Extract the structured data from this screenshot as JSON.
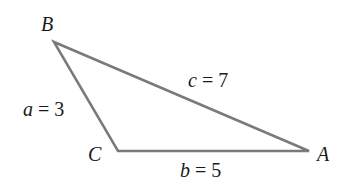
{
  "diagram": {
    "type": "triangle",
    "stroke_color": "#7a7a7a",
    "vertices": {
      "A": {
        "label": "A",
        "x": 309,
        "y": 151
      },
      "B": {
        "label": "B",
        "x": 54,
        "y": 42
      },
      "C": {
        "label": "C",
        "x": 118,
        "y": 151
      }
    },
    "sides": {
      "a": {
        "var": "a",
        "eq": " = ",
        "value": "3"
      },
      "b": {
        "var": "b",
        "eq": " = ",
        "value": "5"
      },
      "c": {
        "var": "c",
        "eq": " = ",
        "value": "7"
      }
    }
  }
}
